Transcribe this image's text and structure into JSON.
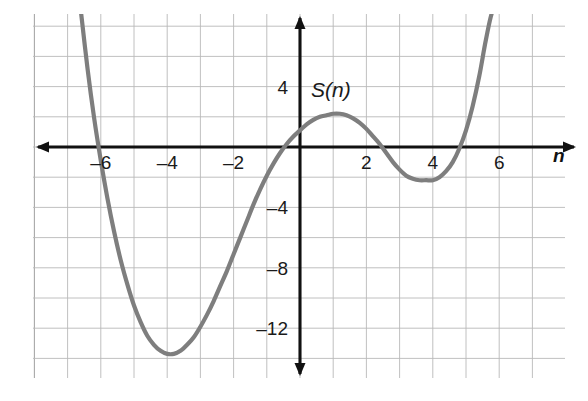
{
  "chart_data": {
    "type": "line",
    "title": "",
    "subtitle": "",
    "xlabel": "n",
    "ylabel": "",
    "function_label": "S(n)",
    "xlim": [
      -8.1,
      8.0
    ],
    "ylim": [
      -16.0,
      8.9
    ],
    "grid": true,
    "grid_step_x": 1,
    "grid_step_y": 2,
    "legend_position": "none",
    "x_ticks": [
      -6,
      -4,
      -2,
      2,
      4,
      6
    ],
    "x_tick_labels": [
      "–6",
      "–4",
      "–2",
      "2",
      "4",
      "6"
    ],
    "y_ticks": [
      4,
      -4,
      -8,
      -12
    ],
    "y_tick_labels": [
      "4",
      "–4",
      "–8",
      "–12"
    ],
    "series": [
      {
        "name": "S(n)",
        "color": "#7e7e7e",
        "x_roots": [
          -5.95,
          0.05,
          2.3,
          5.3
        ],
        "local_extrema": [
          {
            "kind": "minimum",
            "x": -4.0,
            "y": -13.7
          },
          {
            "kind": "maximum",
            "x": 1.2,
            "y": 2.2
          },
          {
            "kind": "minimum",
            "x": 4.0,
            "y": -2.2
          }
        ],
        "x": [
          -6.6,
          -6.4,
          -6.2,
          -6.0,
          -5.8,
          -5.6,
          -5.4,
          -5.2,
          -5.0,
          -4.8,
          -4.6,
          -4.4,
          -4.2,
          -4.0,
          -3.8,
          -3.6,
          -3.4,
          -3.2,
          -3.0,
          -2.8,
          -2.6,
          -2.4,
          -2.2,
          -2.0,
          -1.8,
          -1.6,
          -1.4,
          -1.2,
          -1.0,
          -0.8,
          -0.6,
          -0.4,
          -0.2,
          0.0,
          0.2,
          0.4,
          0.6,
          0.8,
          1.0,
          1.2,
          1.4,
          1.6,
          1.8,
          2.0,
          2.2,
          2.4,
          2.6,
          2.8,
          3.0,
          3.2,
          3.4,
          3.6,
          3.8,
          4.0,
          4.2,
          4.4,
          4.6,
          4.8,
          5.0,
          5.2,
          5.4,
          5.6,
          5.8,
          6.0
        ],
        "y": [
          9.0,
          5.2,
          1.9,
          -0.9,
          -3.4,
          -5.6,
          -7.5,
          -9.1,
          -10.5,
          -11.6,
          -12.5,
          -13.1,
          -13.5,
          -13.7,
          -13.7,
          -13.5,
          -13.1,
          -12.6,
          -11.9,
          -11.1,
          -10.2,
          -9.2,
          -8.2,
          -7.1,
          -6.0,
          -4.9,
          -3.8,
          -2.8,
          -1.9,
          -1.1,
          -0.4,
          0.2,
          0.7,
          1.1,
          1.5,
          1.8,
          2.0,
          2.1,
          2.2,
          2.2,
          2.1,
          1.9,
          1.6,
          1.2,
          0.7,
          0.2,
          -0.4,
          -1.0,
          -1.5,
          -1.9,
          -2.1,
          -2.2,
          -2.2,
          -2.2,
          -2.0,
          -1.6,
          -1.0,
          -0.1,
          1.1,
          2.7,
          4.7,
          7.1,
          9.0,
          9.0
        ]
      }
    ],
    "axes": {
      "x_axis_arrow_both_ends": true,
      "y_axis_arrow_both_ends": true,
      "origin_label_shown": false
    },
    "colors": {
      "curve": "#7e7e7e",
      "axis": "#111111",
      "grid": "#b9b9b9",
      "background": "#ffffff",
      "text": "#1a1a1a"
    }
  }
}
